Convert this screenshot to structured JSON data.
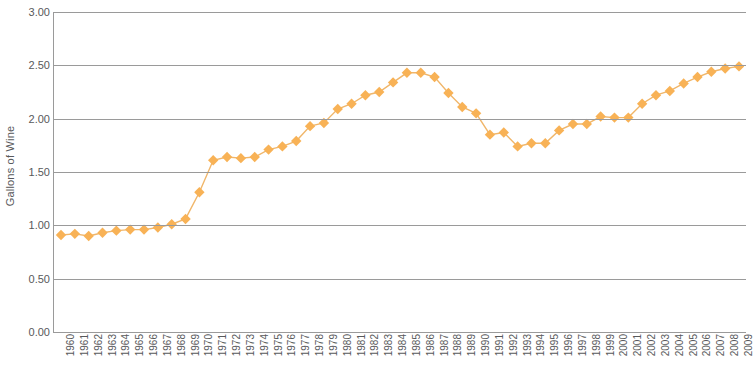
{
  "chart_data": {
    "type": "line",
    "title": "",
    "xlabel": "",
    "ylabel": "Gallons of Wine",
    "ylim": [
      0.0,
      3.0
    ],
    "ytick_labels": [
      "0.00",
      "0.50",
      "1.00",
      "1.50",
      "2.00",
      "2.50",
      "3.00"
    ],
    "ytick_values": [
      0.0,
      0.5,
      1.0,
      1.5,
      2.0,
      2.5,
      3.0
    ],
    "grid": true,
    "legend": "none",
    "marker": "diamond",
    "series_color": "#F8B256",
    "line_color": "#F0B66A",
    "gridline_color": "#9A9A9A",
    "text_color": "#58595B",
    "categories": [
      "1960",
      "1961",
      "1962",
      "1963",
      "1964",
      "1965",
      "1966",
      "1967",
      "1968",
      "1969",
      "1970",
      "1971",
      "1972",
      "1973",
      "1974",
      "1975",
      "1976",
      "1977",
      "1978",
      "1979",
      "1980",
      "1981",
      "1982",
      "1983",
      "1984",
      "1985",
      "1986",
      "1987",
      "1988",
      "1989",
      "1990",
      "1991",
      "1992",
      "1993",
      "1994",
      "1995",
      "1996",
      "1997",
      "1998",
      "1999",
      "2000",
      "2001",
      "2002",
      "2003",
      "2004",
      "2005",
      "2006",
      "2007",
      "2008",
      "2009"
    ],
    "values": [
      0.91,
      0.92,
      0.9,
      0.93,
      0.95,
      0.96,
      0.96,
      0.98,
      1.01,
      1.06,
      1.31,
      1.61,
      1.64,
      1.63,
      1.64,
      1.71,
      1.74,
      1.79,
      1.93,
      1.96,
      2.09,
      2.14,
      2.22,
      2.25,
      2.34,
      2.43,
      2.43,
      2.39,
      2.24,
      2.11,
      2.05,
      1.85,
      1.87,
      1.74,
      1.77,
      1.77,
      1.89,
      1.95,
      1.95,
      2.02,
      2.01,
      2.01,
      2.14,
      2.22,
      2.26,
      2.33,
      2.39,
      2.44,
      2.47,
      2.49
    ]
  }
}
